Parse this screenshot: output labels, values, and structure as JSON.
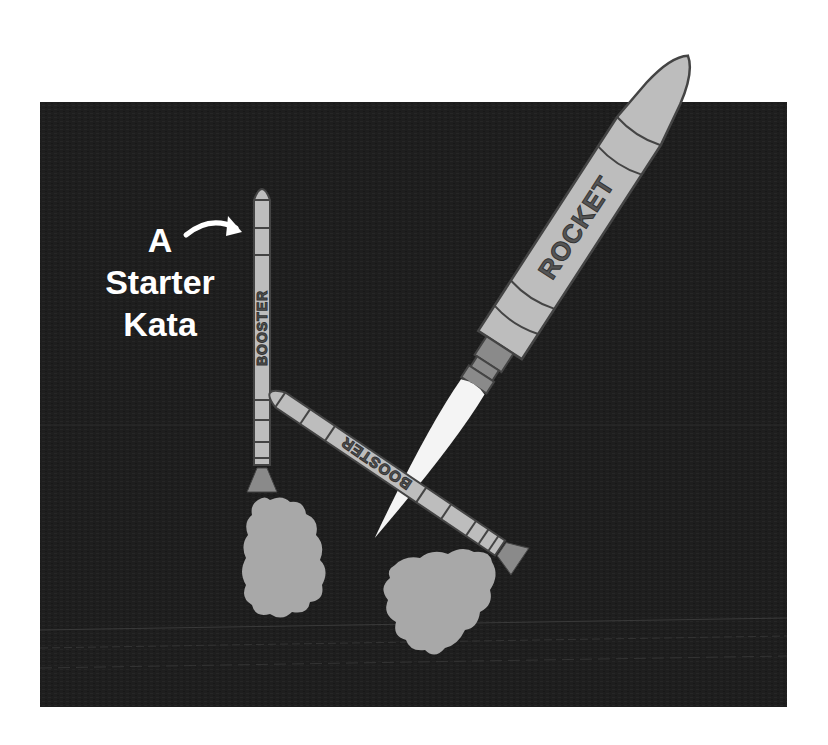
{
  "illustration": {
    "title_lines": [
      "A",
      "Starter",
      "Kata"
    ],
    "rocket_label": "ROCKET",
    "left_booster_label": "BOOSTER",
    "right_booster_label": "BOOSTER",
    "colors": {
      "background": "#ffffff",
      "panel": "#1f1f1f",
      "body": "#bdbdbd",
      "outline": "#444444",
      "nozzle": "#8a8a8a",
      "smoke": "#a8a8a8",
      "flame": "#f4f4f4",
      "text": "#ffffff"
    }
  }
}
